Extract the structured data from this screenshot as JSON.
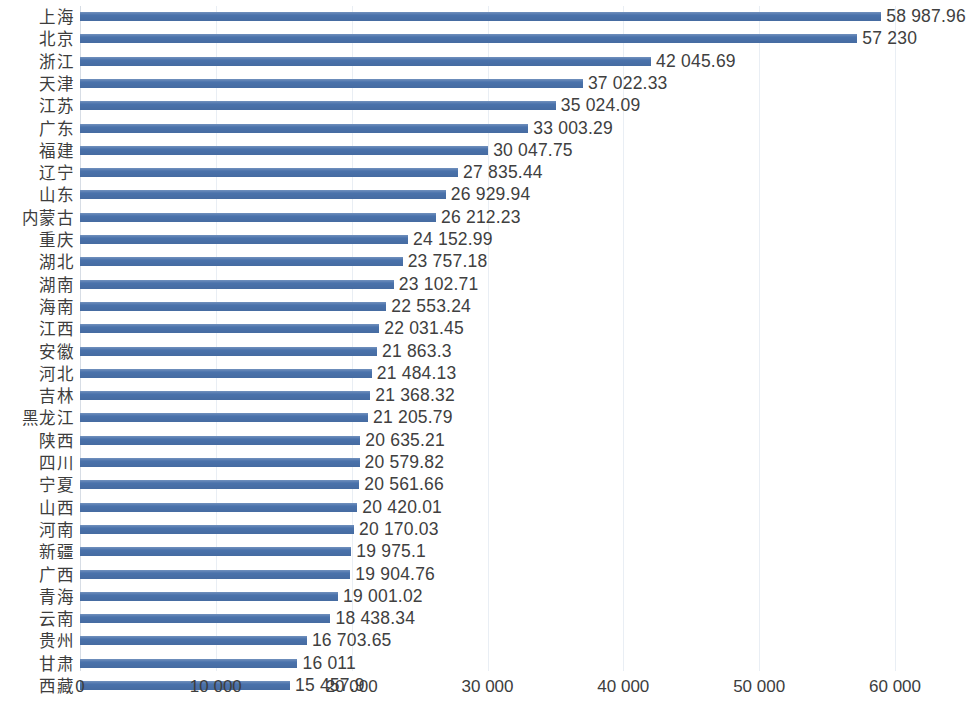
{
  "chart_data": {
    "type": "bar",
    "orientation": "horizontal",
    "title": "",
    "subtitle": "",
    "xlabel": "",
    "ylabel": "",
    "xlim": [
      0,
      60000
    ],
    "xticks": [
      0,
      10000,
      20000,
      30000,
      40000,
      50000,
      60000
    ],
    "xtick_labels": [
      "0",
      "10 000",
      "20 000",
      "30 000",
      "40 000",
      "50 000",
      "60 000"
    ],
    "grid": "vertical",
    "legend": "none",
    "bar_color": "#4a72ab",
    "categories": [
      "上海",
      "北京",
      "浙江",
      "天津",
      "江苏",
      "广东",
      "福建",
      "辽宁",
      "山东",
      "内蒙古",
      "重庆",
      "湖北",
      "湖南",
      "海南",
      "江西",
      "安徽",
      "河北",
      "吉林",
      "黑龙江",
      "陕西",
      "四川",
      "宁夏",
      "山西",
      "河南",
      "新疆",
      "广西",
      "青海",
      "云南",
      "贵州",
      "甘肃",
      "西藏"
    ],
    "values": [
      58987.96,
      57230,
      42045.69,
      37022.33,
      35024.09,
      33003.29,
      30047.75,
      27835.44,
      26929.94,
      26212.23,
      24152.99,
      23757.18,
      23102.71,
      22553.24,
      22031.45,
      21863.3,
      21484.13,
      21368.32,
      21205.79,
      20635.21,
      20579.82,
      20561.66,
      20420.01,
      20170.03,
      19975.1,
      19904.76,
      19001.02,
      18438.34,
      16703.65,
      16011,
      15457.9
    ],
    "value_labels": [
      "58 987.96",
      "57 230",
      "42 045.69",
      "37 022.33",
      "35 024.09",
      "33 003.29",
      "30 047.75",
      "27 835.44",
      "26 929.94",
      "26 212.23",
      "24 152.99",
      "23 757.18",
      "23 102.71",
      "22 553.24",
      "22 031.45",
      "21 863.3",
      "21 484.13",
      "21 368.32",
      "21 205.79",
      "20 635.21",
      "20 579.82",
      "20 561.66",
      "20 420.01",
      "20 170.03",
      "19 975.1",
      "19 904.76",
      "19 001.02",
      "18 438.34",
      "16 703.65",
      "16 011",
      "15 457.9"
    ]
  }
}
